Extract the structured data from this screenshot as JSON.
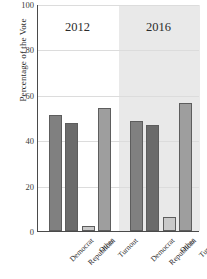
{
  "chart_data": {
    "type": "bar",
    "title": "",
    "xlabel": "",
    "ylabel": "Percentage of the Vote",
    "ylim": [
      0,
      100
    ],
    "yticks": [
      0,
      20,
      40,
      60,
      80,
      100
    ],
    "ytick_labels": [
      "0",
      "20",
      "40",
      "60",
      "80",
      "100"
    ],
    "grid": true,
    "legend": "none",
    "group_labels": [
      "2012",
      "2016"
    ],
    "categories": [
      "Democrat",
      "Republican",
      "Other",
      "Turnout"
    ],
    "series": [
      {
        "name": "2012",
        "values": [
          51,
          47.5,
          2,
          54
        ],
        "shaded": false
      },
      {
        "name": "2016",
        "values": [
          48.5,
          46.5,
          6,
          56.5
        ],
        "shaded": true
      }
    ],
    "bar_colors": {
      "Democrat": "#808080",
      "Republican": "#6b6b6b",
      "Other": "#c9c9c9",
      "Turnout": "#9e9e9e"
    },
    "shade_color": "#e9e9e9",
    "axis_color": "#4a4a4a",
    "grid_color": "#dcdcdc",
    "text_color": "#2b2b2b"
  }
}
